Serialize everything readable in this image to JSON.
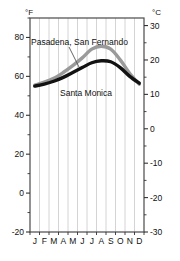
{
  "chart_data": {
    "type": "line",
    "title": "",
    "xlabel": "",
    "ylabel": "",
    "left_axis": {
      "unit": "°F",
      "ticks": [
        80,
        60,
        40,
        20,
        0,
        -20
      ],
      "tick_labels": [
        "80",
        "60",
        "40",
        "20",
        "0",
        "-20"
      ],
      "range": [
        -20,
        90
      ],
      "minor_tick_step": 10
    },
    "right_axis": {
      "unit": "°C",
      "ticks": [
        30,
        20,
        10,
        0,
        -10,
        -20,
        -30
      ],
      "tick_labels": [
        "30",
        "20",
        "10",
        "0",
        "-10",
        "-20",
        "-30"
      ],
      "range": [
        -30,
        32.2
      ],
      "minor_tick_step": 5
    },
    "categories": [
      "J",
      "F",
      "M",
      "A",
      "M",
      "J",
      "J",
      "A",
      "S",
      "O",
      "N",
      "D"
    ],
    "month_names": [
      "January",
      "February",
      "March",
      "April",
      "May",
      "June",
      "July",
      "August",
      "September",
      "October",
      "November",
      "December"
    ],
    "grid": true,
    "grid_orientation": "vertical",
    "legend_position": "inline-annotation",
    "series": [
      {
        "name": "Pasadena, San Fernando",
        "color": "#9a9a9a",
        "unit": "°F",
        "values": [
          55.5,
          57.0,
          59.0,
          62.0,
          65.5,
          69.5,
          74.0,
          75.5,
          74.0,
          68.5,
          61.5,
          56.0
        ]
      },
      {
        "name": "Santa Monica",
        "color": "#121212",
        "unit": "°F",
        "values": [
          55.0,
          56.0,
          57.5,
          59.5,
          62.0,
          64.5,
          67.0,
          68.0,
          67.5,
          64.5,
          60.0,
          56.5
        ]
      }
    ],
    "annotations": [
      {
        "text": "Pasadena, San Fernando",
        "target_series": "Pasadena, San Fernando",
        "leader_line": true
      },
      {
        "text": "Santa Monica",
        "target_series": "Santa Monica",
        "leader_line": false
      }
    ]
  },
  "axes": {
    "left_unit": "°F",
    "right_unit": "°C",
    "left_ticks": [
      "80",
      "60",
      "40",
      "20",
      "0",
      "-20"
    ],
    "right_ticks": [
      "30",
      "20",
      "10",
      "0",
      "-10",
      "-20",
      "-30"
    ],
    "months": [
      "J",
      "F",
      "M",
      "A",
      "M",
      "J",
      "J",
      "A",
      "S",
      "O",
      "N",
      "D"
    ]
  },
  "labels": {
    "pasadena": "Pasadena, San Fernando",
    "santa_monica": "Santa Monica"
  },
  "colors": {
    "pasadena_line": "#9a9a9a",
    "santa_monica_line": "#121212",
    "grid": "#c9c9c9",
    "frame": "#4a4a4a",
    "text": "#111111",
    "background": "#ffffff"
  }
}
